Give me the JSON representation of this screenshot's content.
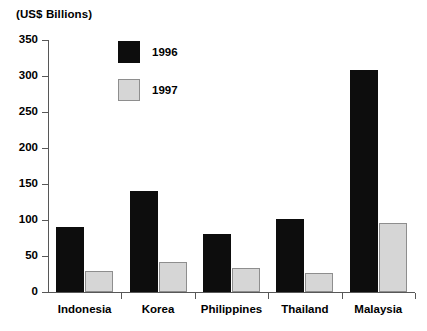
{
  "chart_data": {
    "type": "bar",
    "title": "(US$ Billions)",
    "xlabel": "",
    "ylabel": "",
    "categories": [
      "Indonesia",
      "Korea",
      "Philippines",
      "Thailand",
      "Malaysia"
    ],
    "series": [
      {
        "name": "1996",
        "color": "#0d0d0d",
        "values": [
          90,
          140,
          81,
          101,
          308
        ]
      },
      {
        "name": "1997",
        "color": "#d6d6d6",
        "values": [
          29,
          42,
          33,
          26,
          96
        ]
      }
    ],
    "ylim": [
      0,
      350
    ],
    "yticks": [
      0,
      50,
      100,
      150,
      200,
      250,
      300,
      350
    ],
    "ytick_labels": [
      "0",
      "50",
      "100",
      "150",
      "200",
      "250",
      "300",
      "350"
    ],
    "grid": false,
    "legend_position": "upper-left-inside"
  },
  "legend": {
    "items": [
      {
        "label": "1996",
        "swatch": "black-square-swatch"
      },
      {
        "label": "1997",
        "swatch": "gray-square-swatch"
      }
    ]
  },
  "axis": {
    "y_axis_name": "y-axis",
    "x_axis_name": "x-axis"
  }
}
